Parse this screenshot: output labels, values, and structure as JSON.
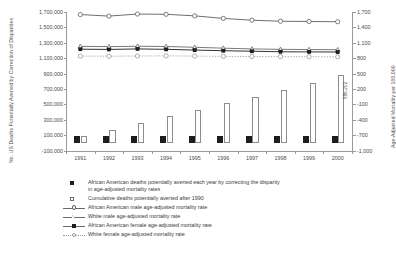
{
  "chart_data": {
    "type": "bar",
    "title": "",
    "subtitle": "",
    "categories": [
      "1991",
      "1992",
      "1993",
      "1994",
      "1995",
      "1996",
      "1997",
      "1998",
      "1999",
      "2000"
    ],
    "xlabel": "",
    "left_axis": {
      "label": "No. US Deaths Potentially Averted by Correction of Disparities",
      "ticks": [
        "1,700,000",
        "1,500,000",
        "1,300,000",
        "1,100,000",
        "900,000",
        "700,000",
        "500,000",
        "300,000",
        "100,000",
        "-100,000"
      ],
      "ylim": [
        -100000,
        1700000
      ],
      "tick_step": 200000
    },
    "right_axis": {
      "label": "Age-Adjusted Mortality per 100,000",
      "ticks": [
        "1,700",
        "1,400",
        "1,100",
        "800",
        "500",
        "200",
        "-100",
        "-400",
        "-700",
        "-1,000"
      ],
      "ylim": [
        -1000,
        1700
      ],
      "tick_step": 300
    },
    "grid": false,
    "legend_position": "below",
    "series": [
      {
        "name": "African American deaths potentially averted each year by correcting the disparity in age-adjusted mortality rates",
        "type": "bar",
        "axis": "left",
        "marker": "filled-square",
        "color": "#1d1d1d",
        "values": [
          84000,
          86000,
          87000,
          86000,
          87000,
          85000,
          85000,
          88000,
          83000,
          83000
        ]
      },
      {
        "name": "Cumulative deaths potentially averted after 1990",
        "type": "bar",
        "axis": "left",
        "marker": "open-square",
        "color": "#ffffff",
        "values": [
          84000,
          170000,
          257000,
          343000,
          430000,
          515000,
          600000,
          688000,
          771000,
          886202
        ],
        "point_labels": [
          null,
          null,
          null,
          null,
          null,
          null,
          null,
          null,
          null,
          "886,202"
        ]
      },
      {
        "name": "African American male age-adjusted mortality rate",
        "type": "line",
        "axis": "right",
        "marker": "open-circle",
        "color": "#5e5e5e",
        "linestyle": "solid",
        "values": [
          1650,
          1620,
          1660,
          1655,
          1625,
          1575,
          1540,
          1520,
          1515,
          1510
        ]
      },
      {
        "name": "White male age-adjusted mortality rate",
        "type": "line",
        "axis": "right",
        "marker": "open-triangle",
        "color": "#6a6a6a",
        "linestyle": "solid",
        "values": [
          1030,
          1025,
          1032,
          1028,
          1012,
          995,
          980,
          972,
          968,
          965
        ]
      },
      {
        "name": "African American female age-adjusted mortality rate",
        "type": "line",
        "axis": "right",
        "marker": "filled-square",
        "color": "#1d1d1d",
        "linestyle": "solid",
        "values": [
          975,
          970,
          980,
          972,
          958,
          945,
          935,
          925,
          922,
          920
        ]
      },
      {
        "name": "White female age-adjusted mortality rate",
        "type": "line",
        "axis": "right",
        "marker": "open-circle-light",
        "color": "#9a9a9a",
        "linestyle": "dotted",
        "values": [
          840,
          838,
          842,
          845,
          840,
          835,
          832,
          830,
          828,
          826
        ]
      }
    ]
  },
  "legend": [
    {
      "key": "filled-square",
      "line1": "African American deaths potentially averted each year by correcting the disparity",
      "line2": "in age-adjusted mortality rates"
    },
    {
      "key": "open-square",
      "line1": "Cumulative deaths potentially averted after 1990",
      "line2": ""
    },
    {
      "key": "line-open-circle",
      "line1": "African American male age-adjusted mortality rate",
      "line2": ""
    },
    {
      "key": "line-open-triangle",
      "line1": "White male age-adjusted mortality rate",
      "line2": ""
    },
    {
      "key": "line-filled-square",
      "line1": "African American female age-adjusted mortality rate",
      "line2": ""
    },
    {
      "key": "line-dotted-open-circle",
      "line1": "White female age-adjusted mortality rate",
      "line2": ""
    }
  ]
}
